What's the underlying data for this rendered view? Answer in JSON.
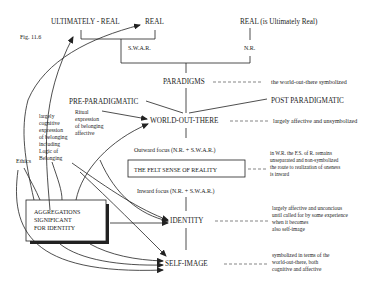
{
  "figure": {
    "label": "Fig. 11.6"
  },
  "top": {
    "ultimately_real": "ULTIMATELY - REAL",
    "real": "REAL",
    "real_is_ultimately": "REAL (is Ultimately Real)",
    "swar": "S.W.A.R.",
    "nr": "N.R."
  },
  "nodes": {
    "paradigms": "PARADIGMS",
    "pre_paradigmatic": "PRE-PARADIGMATIC",
    "post_paradigmatic": "POST PARADIGMATIC",
    "world_out_there": "WORLD-OUT-THERE",
    "outward_focus": "Outward focus (N.R. + S.W.A.R.)",
    "felt_sense": "THE FELT SENSE OF REALITY",
    "inward_focus": "Inward focus (N.R. + S.W.A.R.)",
    "identity": "IDENTITY",
    "self_image": "SELF-IMAGE"
  },
  "left": {
    "ethics": "Ethics",
    "cognitive": [
      "largely",
      "cognitive",
      "expression",
      "of belonging",
      "including",
      "Logic of",
      "Belonging"
    ],
    "ritual": [
      "Ritual",
      "expression",
      "of belonging",
      "affective"
    ],
    "aggregations": [
      "AGGREGATIONS",
      "SIGNIFICANT",
      "FOR IDENTITY"
    ]
  },
  "notes": {
    "paradigms": "the world-out-there symbolized",
    "world": "largely affective and unsymbolized",
    "felt_sense": [
      "in W.R. the F.S. of R. remains",
      "unseparated and non-symbolized",
      "the route to realization of oneness",
      "is inward"
    ],
    "identity": [
      "largely affective and unconcious",
      "until called for by some experience",
      "when it becomes",
      "also self-image"
    ],
    "self_image": [
      "symbolized in terms of the",
      "world-out-there, both",
      "cognitive and affective"
    ]
  }
}
